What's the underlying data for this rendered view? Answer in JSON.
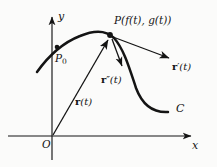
{
  "figure": {
    "type": "vector-valued-function-diagram",
    "background_color": "#fbfbfa",
    "ink_color": "#141414"
  },
  "axes": {
    "x_label": "x",
    "y_label": "y",
    "origin_label": "O",
    "x_axis": {
      "x1": 8,
      "y1": 136,
      "x2": 197,
      "y2": 136
    },
    "y_axis": {
      "x1": 52,
      "y1": 12,
      "x2": 52,
      "y2": 160
    }
  },
  "curve": {
    "label": "C",
    "label_x": 176,
    "label_y": 107,
    "path": "M 37,72 C 47,58 62,43 80,36 C 94,30 106,30 114,38 C 124,49 130,70 136,88 C 142,104 152,113 168,112"
  },
  "points": [
    {
      "id": "P0",
      "name": "P",
      "subscript": "0",
      "x": 57,
      "y": 47,
      "label_x": 57,
      "label_y": 55,
      "dot_radius": 2.3
    },
    {
      "id": "P",
      "name": "P(f(t), g(t))",
      "x": 110,
      "y": 35,
      "label_x": 114,
      "label_y": 18,
      "dot_radius": 2.8
    }
  ],
  "vectors": [
    {
      "id": "position",
      "name": "r",
      "primes": "",
      "argument": "(t)",
      "from_x": 53,
      "from_y": 135,
      "to_x": 109,
      "to_y": 38,
      "label_x": 77,
      "label_y": 101
    },
    {
      "id": "velocity",
      "name": "r",
      "primes": "′",
      "argument": "(t)",
      "from_x": 113,
      "from_y": 37,
      "to_x": 172,
      "to_y": 59,
      "label_x": 174,
      "label_y": 66
    },
    {
      "id": "acceleration",
      "name": "r",
      "primes": "″",
      "argument": "(t)",
      "from_x": 112,
      "from_y": 39,
      "to_x": 123,
      "to_y": 69,
      "label_x": 104,
      "label_y": 78
    }
  ],
  "labels": {
    "point_p_text": "P(f(t), g(t))",
    "point_p0_text": "P",
    "point_p0_sub": "0",
    "curve_text": "C",
    "origin_text": "O",
    "axis_x_text": "x",
    "axis_y_text": "y"
  }
}
